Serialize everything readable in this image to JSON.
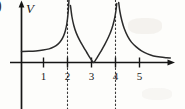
{
  "figure": {
    "leading_paren": ")",
    "y_axis_label": "V",
    "x_axis_label": ""
  },
  "chart_data": {
    "type": "line",
    "title": "",
    "xlabel": "",
    "ylabel": "V",
    "xlim": [
      0,
      6.2
    ],
    "ylim": [
      0,
      3.2
    ],
    "grid": false,
    "legend": null,
    "x_ticks": [
      1,
      2,
      3,
      4,
      5
    ],
    "x_tick_labels": [
      "1",
      "2",
      "3",
      "4",
      "5"
    ],
    "y_ticks": [],
    "y_tick_labels": [],
    "asymptotes": [
      {
        "x": 2,
        "style": "dotted"
      },
      {
        "x": 4,
        "style": "dotted"
      }
    ],
    "zeros": [
      3
    ],
    "series": [
      {
        "name": "branch-1",
        "domain": [
          0,
          2
        ],
        "description": "rises from flat plateau near V=0.55 at x=0 to +infinity as x approaches 2",
        "points": [
          [
            0.0,
            0.55
          ],
          [
            0.3,
            0.56
          ],
          [
            0.6,
            0.58
          ],
          [
            0.9,
            0.62
          ],
          [
            1.15,
            0.68
          ],
          [
            1.35,
            0.78
          ],
          [
            1.52,
            0.92
          ],
          [
            1.65,
            1.1
          ],
          [
            1.75,
            1.32
          ],
          [
            1.83,
            1.6
          ],
          [
            1.89,
            1.95
          ],
          [
            1.94,
            2.45
          ],
          [
            1.97,
            2.95
          ],
          [
            1.98,
            3.2
          ]
        ]
      },
      {
        "name": "branch-2",
        "domain": [
          2,
          4
        ],
        "description": "U-shaped well, falls from +infinity at x=2 to V=0 at x=3 and rises to +infinity at x=4",
        "points": [
          [
            2.04,
            2.85
          ],
          [
            2.1,
            2.3
          ],
          [
            2.18,
            1.85
          ],
          [
            2.28,
            1.48
          ],
          [
            2.42,
            1.12
          ],
          [
            2.58,
            0.78
          ],
          [
            2.72,
            0.5
          ],
          [
            2.85,
            0.24
          ],
          [
            2.95,
            0.06
          ],
          [
            3.0,
            0.0
          ],
          [
            3.06,
            0.07
          ],
          [
            3.16,
            0.26
          ],
          [
            3.3,
            0.54
          ],
          [
            3.46,
            0.88
          ],
          [
            3.62,
            1.26
          ],
          [
            3.76,
            1.68
          ],
          [
            3.86,
            2.1
          ],
          [
            3.93,
            2.55
          ],
          [
            3.97,
            2.95
          ]
        ]
      },
      {
        "name": "branch-3",
        "domain": [
          4,
          6.2
        ],
        "description": "decays from +infinity at x=4 toward the horizontal axis as x increases",
        "points": [
          [
            4.05,
            3.0
          ],
          [
            4.1,
            2.55
          ],
          [
            4.18,
            2.1
          ],
          [
            4.28,
            1.7
          ],
          [
            4.42,
            1.32
          ],
          [
            4.58,
            1.02
          ],
          [
            4.78,
            0.78
          ],
          [
            5.0,
            0.58
          ],
          [
            5.25,
            0.43
          ],
          [
            5.5,
            0.33
          ],
          [
            5.78,
            0.27
          ],
          [
            6.05,
            0.24
          ],
          [
            6.2,
            0.23
          ]
        ]
      }
    ]
  }
}
